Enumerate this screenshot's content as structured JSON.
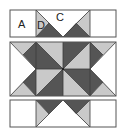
{
  "diagram": {
    "type": "quilt-block-assembly",
    "labels": {
      "A": "A",
      "D": "D",
      "C": "C"
    },
    "colors": {
      "light": "#c9c9c9",
      "dark": "#555555",
      "background": "#ffffff",
      "outline": "#555555"
    },
    "rows": [
      {
        "name": "top-row",
        "pieces": [
          "A",
          "D",
          "C",
          "D",
          "A"
        ]
      },
      {
        "name": "center-row",
        "pieces": [
          "flying-geese-left",
          "pinwheel",
          "flying-geese-right"
        ]
      },
      {
        "name": "bottom-row",
        "pieces": [
          "A",
          "D",
          "C",
          "D",
          "A"
        ]
      }
    ]
  }
}
